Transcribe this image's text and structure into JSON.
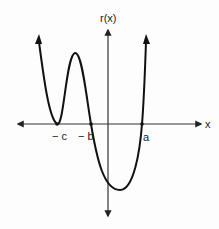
{
  "diagram": {
    "y_axis_label": "r(x)",
    "x_axis_label": "x",
    "x_marks": [
      {
        "label": "− c",
        "x": 57,
        "tx": 52,
        "ty": 140
      },
      {
        "label": "− b",
        "x": 91,
        "tx": 79,
        "ty": 140
      },
      {
        "label": "a",
        "x": 142,
        "tx": 143,
        "ty": 141
      }
    ],
    "curve_description": "Polynomial r(x) touching x-axis at -c, crossing at -b and a; rises at both ends",
    "colors": {
      "axis": "#333333",
      "curve": "#111111",
      "text": "#222222"
    }
  }
}
